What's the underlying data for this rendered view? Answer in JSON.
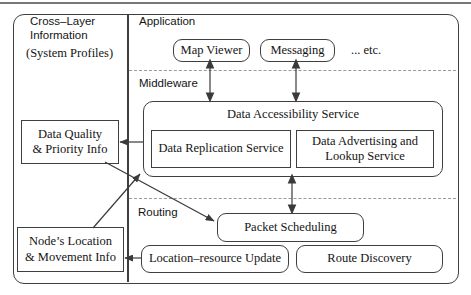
{
  "colors": {
    "line": "#3f3f3f",
    "dash": "#9a9a9a",
    "text": "#141414",
    "background": "#ffffff",
    "top_rule": "#787878"
  },
  "left_panel": {
    "title": [
      "Cross–Layer",
      "Information"
    ],
    "subtitle": "(System Profiles)",
    "data_quality_box": [
      "Data Quality",
      "& Priority Info"
    ],
    "node_location_box": [
      "Node’s Location",
      "& Movement Info"
    ]
  },
  "application_layer": {
    "label": "Application",
    "map_viewer_box": "Map Viewer",
    "messaging_box": "Messaging",
    "etc_text": "... etc."
  },
  "middleware_layer": {
    "label": "Middleware",
    "data_accessibility_title": "Data Accessibility Service",
    "data_replication_box": "Data Replication Service",
    "data_advertising_box": [
      "Data Advertising and",
      "Lookup Service"
    ]
  },
  "routing_layer": {
    "label": "Routing",
    "packet_scheduling_box": "Packet Scheduling",
    "location_update_box": "Location–resource Update",
    "route_discovery_box": "Route Discovery"
  }
}
